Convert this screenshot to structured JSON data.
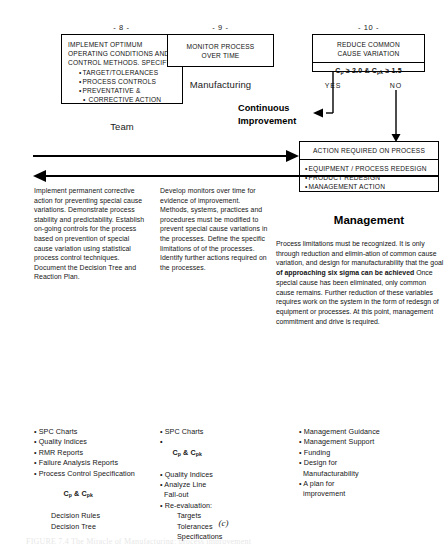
{
  "figure": {
    "caption": "(c)",
    "tail_text": "FIGURE 7.4  The Miracle of Manufacturing: process improvement"
  },
  "steps": [
    {
      "number": "- 8 -",
      "box_title": "IMPLEMENT OPTIMUM\nOPERATING CONDITIONS AND\nCONTROL METHODS. SPECIFY:",
      "box_bullets": [
        "TARGET/TOLERANCES",
        "PROCESS CONTROLS",
        "PREVENTATIVE &",
        "CORRECTIVE ACTION"
      ],
      "role": "Team"
    },
    {
      "number": "- 9 -",
      "box_title": "MONITOR PROCESS\nOVER TIME",
      "role": "Manufacturing"
    },
    {
      "number": "- 10 -",
      "box_title": "REDUCE COMMON\nCAUSE VARIATION",
      "criterion": "Cp ≥ 2.0 & Cpk ≥ 1.5",
      "criterion_parts": {
        "c1": "C",
        "c1_sub": "p",
        "op1": " ≥ 2.0 & ",
        "c2": "C",
        "c2_sub": "pk",
        "op2": " ≥ 1.5"
      },
      "role": "Management"
    }
  ],
  "decision": {
    "yes_label": "YES",
    "no_label": "NO",
    "continuous_improvement": "Continuous\nImprovement"
  },
  "action_box": {
    "header": "ACTION REQUIRED ON PROCESS",
    "items": [
      "EQUIPMENT / PROCESS REDESIGN",
      "PRODUCT REDESIGN",
      "MANAGEMENT ACTION"
    ]
  },
  "descriptions": {
    "team": "Implement permanent corrective action for preventing special cause variations.  Demonstrate process stability and predictability.  Establish on-going controls for the process based on prevention of special cause variation using statistical process control techniques. Document the Decision Tree and Reaction Plan.",
    "manufacturing": "Develop monitors over time for evidence of improvement.  Methods, systems,  practices and procedures must be modified to prevent special cause variations in the processes.  Define the specific limitations of of the processes.  Identify further actions required on the processes.",
    "management_part1": "Process limitations must be recognized. It is only through reduction and elimin-ation of common cause variation, and design for manufacturability that the goal ",
    "management_bold": "of approaching six sigma can be achieved",
    "management_part2": " Once special cause has been eliminated, only common cause remains. Further reduction of these variables requires work on the system in the form of redesgn of equipment or processes.  At this point, management commitment and drive is required."
  },
  "deliverables": {
    "team": [
      {
        "text": "SPC Charts",
        "type": "lead"
      },
      {
        "text": "Quality Indices",
        "type": "lead"
      },
      {
        "text": "RMR Reports",
        "type": "lead"
      },
      {
        "text": "Failure Analysis Reports",
        "type": "lead"
      },
      {
        "text": "Process Control Specification",
        "type": "lead"
      },
      {
        "text": "Cp & Cpk",
        "type": "sub-bold"
      },
      {
        "text": "Decision Rules",
        "type": "sub"
      },
      {
        "text": "Decision Tree",
        "type": "sub"
      }
    ],
    "manufacturing": [
      {
        "text": "SPC Charts",
        "type": "lead"
      },
      {
        "text": "Cp & Cpk",
        "type": "lead-bold"
      },
      {
        "text": "Quality Indices",
        "type": "lead"
      },
      {
        "text": "Analyze Line",
        "type": "lead"
      },
      {
        "text": "Fall-out",
        "type": "cont"
      },
      {
        "text": "Re-evaluation:",
        "type": "lead"
      },
      {
        "text": "Targets",
        "type": "sub"
      },
      {
        "text": "Tolerances",
        "type": "sub"
      },
      {
        "text": "Specifications",
        "type": "sub"
      }
    ],
    "management": [
      {
        "text": "Management Guidance",
        "type": "lead"
      },
      {
        "text": "Management Support",
        "type": "lead"
      },
      {
        "text": "Funding",
        "type": "lead"
      },
      {
        "text": "Design for",
        "type": "lead"
      },
      {
        "text": "Manufacturability",
        "type": "cont"
      },
      {
        "text": "A plan for",
        "type": "lead"
      },
      {
        "text": "improvement",
        "type": "cont"
      }
    ]
  },
  "colors": {
    "ink": "#111111",
    "line": "#000000",
    "background": "#ffffff"
  }
}
